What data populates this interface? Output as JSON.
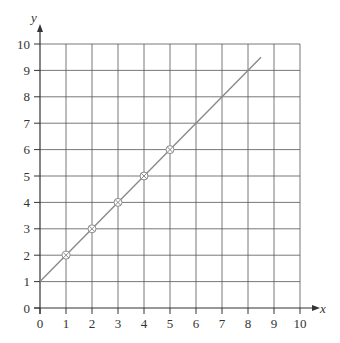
{
  "chart_data": {
    "type": "line",
    "title": "",
    "xlabel": "x",
    "ylabel": "y",
    "xlim": [
      0,
      10
    ],
    "ylim": [
      0,
      10
    ],
    "x_ticks": [
      0,
      1,
      2,
      3,
      4,
      5,
      6,
      7,
      8,
      9,
      10
    ],
    "y_ticks": [
      0,
      1,
      2,
      3,
      4,
      5,
      6,
      7,
      8,
      9,
      10
    ],
    "grid": true,
    "legend": null,
    "series": [
      {
        "name": "line",
        "type": "line",
        "x": [
          0,
          8.5
        ],
        "y": [
          1,
          9.5
        ],
        "equation": "y = x + 1",
        "color": "#8a8a8a"
      },
      {
        "name": "plotted points",
        "type": "scatter",
        "marker": "circled-x",
        "x": [
          1,
          2,
          3,
          4,
          5
        ],
        "y": [
          2,
          3,
          4,
          5,
          6
        ],
        "color": "#8a8a8a"
      }
    ]
  },
  "colors": {
    "axis": "#333333",
    "grid": "#555555",
    "line": "#8a8a8a"
  }
}
